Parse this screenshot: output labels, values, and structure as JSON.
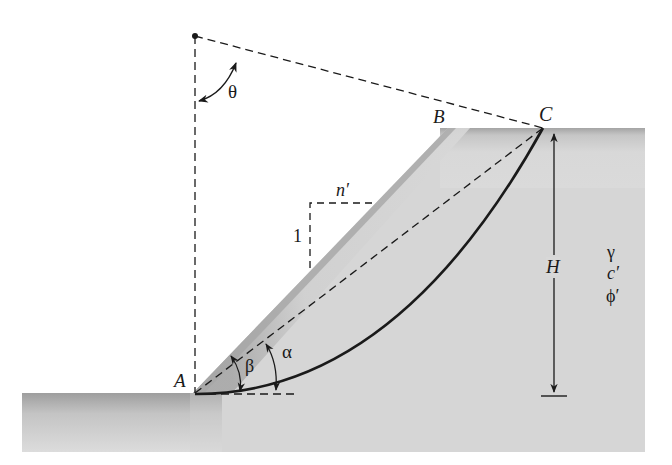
{
  "diagram": {
    "type": "slope-stability-circular-failure",
    "points": {
      "A": "A",
      "B": "B",
      "C": "C"
    },
    "angles": {
      "theta": "θ",
      "beta": "β",
      "alpha": "α"
    },
    "slope_ratio": {
      "horizontal": "n′",
      "vertical": "1"
    },
    "height": "H",
    "soil_properties": {
      "unit_weight": "γ",
      "cohesion": "c′",
      "friction_angle": "ϕ′"
    },
    "colors": {
      "soil_dark": "#9a9a9a",
      "soil_light": "#d9d9d9",
      "line": "#1a1a1a"
    }
  }
}
